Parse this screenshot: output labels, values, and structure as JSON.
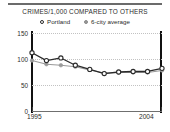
{
  "chart_data": {
    "type": "line",
    "title": "CRIMES/1,000 COMPARED TO OTHERS",
    "xlabel": "",
    "ylabel": "",
    "x": [
      1995,
      1996,
      1997,
      1998,
      1999,
      2000,
      2001,
      2002,
      2003,
      2004
    ],
    "xlim": [
      1995,
      2004
    ],
    "ylim": [
      0,
      150
    ],
    "yticks": [
      0,
      50,
      100,
      150
    ],
    "xticks": [
      1995,
      2004
    ],
    "xtick_labels": [
      "1995",
      "2004"
    ],
    "ytick_labels": [
      "0",
      "50",
      "100",
      "150"
    ],
    "grid": true,
    "legend_position": "top-center",
    "series": [
      {
        "name": "Portland",
        "marker": "open-circle",
        "color": "#2b2b2b",
        "values": [
          112,
          97,
          102,
          88,
          80,
          72,
          75,
          76,
          76,
          82
        ]
      },
      {
        "name": "6-city average",
        "marker": "filled-circle",
        "color": "#9a9a9a",
        "values": [
          97,
          90,
          88,
          85,
          79,
          73,
          74,
          74,
          74,
          78
        ]
      }
    ]
  },
  "legend": {
    "entries": [
      {
        "label": "Portland",
        "marker": "open-circle-marker"
      },
      {
        "label": "6-city average",
        "marker": "filled-circle-marker"
      }
    ]
  },
  "axes": {
    "y_labels": [
      "150",
      "100",
      "50",
      "0"
    ],
    "x_start_label": "1995",
    "x_end_label": "2004"
  }
}
